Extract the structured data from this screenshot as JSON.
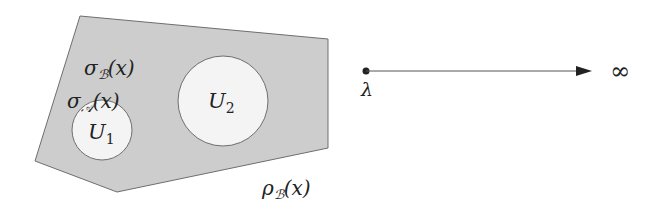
{
  "diagram": {
    "colors": {
      "region_fill": "#cdcdcd",
      "region_stroke": "#6e6e6e",
      "hole_fill": "#f4f4f4",
      "hole_stroke": "#6e6e6e",
      "ink": "#222222"
    },
    "region": {
      "name": "shaded-polygon",
      "vertices": [
        [
          80,
          16
        ],
        [
          328,
          39
        ],
        [
          328,
          148
        ],
        [
          117,
          192
        ],
        [
          35,
          161
        ]
      ]
    },
    "holes": [
      {
        "id": "U1",
        "label_main": "U",
        "label_sub": "1",
        "cx": 102,
        "cy": 130,
        "r": 30
      },
      {
        "id": "U2",
        "label_main": "U",
        "label_sub": "2",
        "cx": 223,
        "cy": 101,
        "r": 45
      }
    ],
    "labels": {
      "sigma_B": {
        "main": "σ",
        "sub": "ℬ",
        "arg": "(x)"
      },
      "sigma_A": {
        "main": "σ",
        "sub": "𝒜",
        "arg": "(x)"
      },
      "rho_B": {
        "main": "ρ",
        "sub": "ℬ",
        "arg": "(x)"
      }
    },
    "ray": {
      "start": [
        366,
        71
      ],
      "end": [
        592,
        71
      ],
      "start_label": "λ",
      "end_label": "∞"
    }
  }
}
